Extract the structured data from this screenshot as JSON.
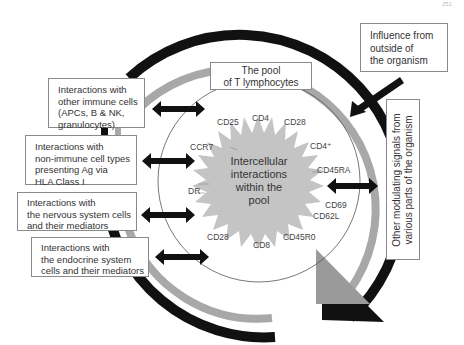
{
  "page": {
    "number": "251"
  },
  "pool_title": {
    "lines": [
      "The pool",
      "of T lymphocytes"
    ]
  },
  "center": {
    "lines": [
      "Intercellular",
      "interactions",
      "within the",
      "pool"
    ]
  },
  "left_boxes": [
    {
      "id": "immune",
      "lines": [
        "Interactions with",
        "other immune cells",
        "(APCs, B & NK,",
        "granulocytes)"
      ]
    },
    {
      "id": "non-immune",
      "lines": [
        "Interactions with",
        "non-immune cell types",
        "presenting Ag via",
        "HLA Class I"
      ]
    },
    {
      "id": "nervous",
      "lines": [
        "Interactions with",
        "the nervous system cells",
        "and their mediators"
      ]
    },
    {
      "id": "endocrine",
      "lines": [
        "Interactions with",
        "the endocrine system",
        "cells and their mediators"
      ]
    }
  ],
  "outside_influence": {
    "lines": [
      "Influence from",
      "outside of",
      "the organism"
    ]
  },
  "modulating_signals": {
    "lines": [
      "Other modulating signals from",
      "various parts of the organism"
    ]
  },
  "markers": [
    {
      "label": "CD25"
    },
    {
      "label": "CD4"
    },
    {
      "label": "CD28"
    },
    {
      "label": "CD4⁺"
    },
    {
      "label": "CCR7"
    },
    {
      "label": "CD45RA"
    },
    {
      "label": "DR"
    },
    {
      "label": "CD69"
    },
    {
      "label": "CD62L"
    },
    {
      "label": "CD28"
    },
    {
      "label": "CD45R0"
    },
    {
      "label": "CD8"
    }
  ],
  "colors": {
    "outer_arc": "#111111",
    "inner_arc": "#a8a8a8",
    "starburst": "#c4c4c4",
    "arrow": "#111111",
    "circle_line": "#555555",
    "box_border": "#8a8a8a"
  }
}
